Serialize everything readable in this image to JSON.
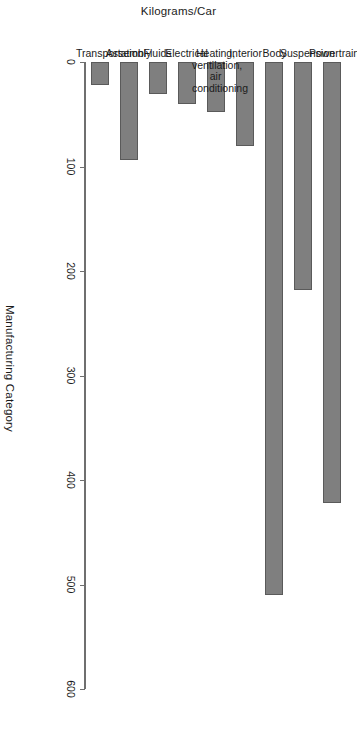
{
  "chart_data": {
    "type": "bar",
    "orientation": "vertical",
    "title": "",
    "xlabel": "Manufacturing Category",
    "ylabel": "Kilograms/Car",
    "ylim": [
      0,
      600
    ],
    "yticks": [
      0,
      100,
      200,
      300,
      400,
      500,
      600
    ],
    "ytick_labels": [
      "0",
      "100",
      "200",
      "300",
      "400",
      "500",
      "600"
    ],
    "grid": false,
    "legend": null,
    "bar_color": "#7f7f7f",
    "bar_edge_color": "#5a5a5a",
    "categories": [
      "Powertrain",
      "Suspension",
      "Body",
      "Interior",
      "Heating,\nventilation, air\nconditioning",
      "Electrical",
      "Fluids",
      "Assembly",
      "Transportation"
    ],
    "values": [
      422,
      218,
      510,
      80,
      48,
      40,
      31,
      94,
      22
    ]
  },
  "axes": {
    "value_axis_label": "Kilograms/Car",
    "category_axis_label": "Manufacturing Category"
  }
}
